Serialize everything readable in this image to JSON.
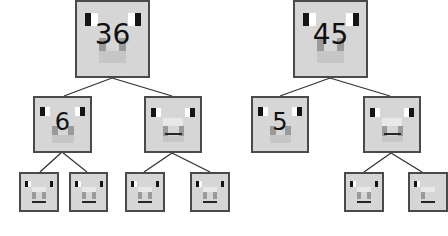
{
  "diagram": {
    "type": "factor-tree",
    "colors": {
      "node_fill": "#d6d6d6",
      "node_border": "#4a4a4a",
      "edge": "#333333",
      "eye": "#151515"
    },
    "trees": [
      {
        "root": {
          "label": "36"
        },
        "children": [
          {
            "label": "6",
            "children": [
              {
                "label": ""
              },
              {
                "label": ""
              }
            ]
          },
          {
            "label": "",
            "children": [
              {
                "label": ""
              },
              {
                "label": ""
              }
            ]
          }
        ]
      },
      {
        "root": {
          "label": "45"
        },
        "children": [
          {
            "label": "5",
            "children": []
          },
          {
            "label": "",
            "children": [
              {
                "label": ""
              },
              {
                "label": ""
              }
            ]
          }
        ]
      }
    ]
  }
}
